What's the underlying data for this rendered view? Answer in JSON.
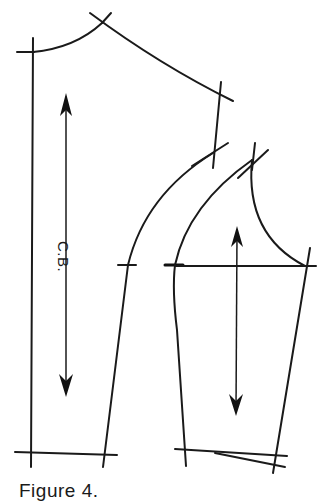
{
  "figure": {
    "caption": "Figure 4.",
    "labels": {
      "center_back": "C.B."
    },
    "pieces": [
      {
        "name": "back-bodice",
        "grainline": "vertical double-headed arrow",
        "label": "C.B."
      },
      {
        "name": "sleeve",
        "grainline": "vertical double-headed arrow"
      }
    ],
    "colors": {
      "line": "#1a1a1a",
      "background": "#ffffff"
    }
  }
}
